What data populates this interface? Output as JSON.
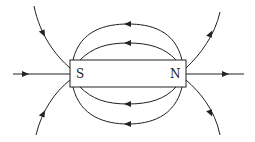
{
  "diagram": {
    "magnet": {
      "south_label": "S",
      "north_label": "N"
    },
    "colors": {
      "line": "#222222",
      "background": "#ffffff"
    }
  }
}
